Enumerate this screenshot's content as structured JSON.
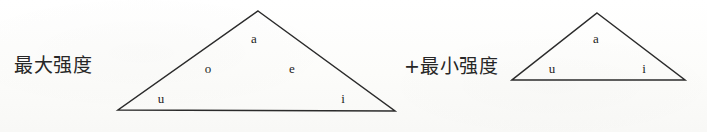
{
  "figure": {
    "background_color": "#fdfdfb",
    "ink_color": "#2b2b2b"
  },
  "diagrams": [
    {
      "id": "max-intensity-triangle",
      "label": "最大强度",
      "label_x": 14,
      "label_y": 56,
      "apex": {
        "x": 258,
        "y": 11
      },
      "base_left": {
        "x": 118,
        "y": 110
      },
      "base_right": {
        "x": 395,
        "y": 111
      },
      "stroke_width": 1.5,
      "vowels": [
        {
          "symbol": "a",
          "x": 254,
          "y": 38
        },
        {
          "symbol": "o",
          "x": 208,
          "y": 68
        },
        {
          "symbol": "e",
          "x": 292,
          "y": 68
        },
        {
          "symbol": "u",
          "x": 161,
          "y": 98
        },
        {
          "symbol": "i",
          "x": 343,
          "y": 98
        }
      ]
    },
    {
      "id": "min-intensity-triangle",
      "label": "+最小强度",
      "label_x": 404,
      "label_y": 57,
      "apex": {
        "x": 597,
        "y": 13
      },
      "base_left": {
        "x": 512,
        "y": 80
      },
      "base_right": {
        "x": 685,
        "y": 80
      },
      "stroke_width": 1.5,
      "vowels": [
        {
          "symbol": "a",
          "x": 596,
          "y": 38
        },
        {
          "symbol": "u",
          "x": 552,
          "y": 68
        },
        {
          "symbol": "i",
          "x": 644,
          "y": 68
        }
      ]
    }
  ]
}
